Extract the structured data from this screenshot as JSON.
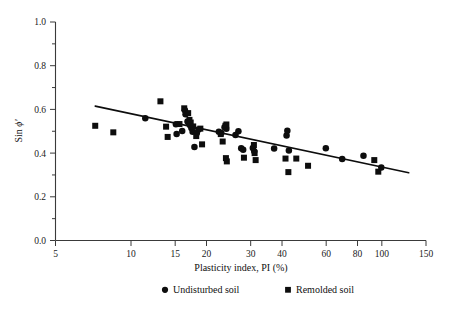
{
  "figure": {
    "background": "#ffffff",
    "ink_color": "#0d0d0d"
  },
  "axes": {
    "x": {
      "title": "Plasticity index, PI (%)",
      "scale": "log",
      "range": [
        5,
        150
      ],
      "tick_values": [
        5,
        10,
        15,
        20,
        30,
        40,
        60,
        80,
        100,
        150
      ],
      "tick_labels": [
        "5",
        "10",
        "15",
        "20",
        "30",
        "40",
        "60",
        "80",
        "100",
        "150"
      ]
    },
    "y": {
      "title_prefix": "Sin ",
      "title_symbol": "ϕ′",
      "title_full": "Sin ϕ′",
      "scale": "linear",
      "range": [
        0.0,
        1.0
      ],
      "tick_values": [
        0.0,
        0.2,
        0.4,
        0.6,
        0.8,
        1.0
      ],
      "tick_labels": [
        "0.0",
        "0.2",
        "0.4",
        "0.6",
        "0.8",
        "1.0"
      ]
    }
  },
  "legend": {
    "position": "below-axis-center",
    "entries": [
      {
        "marker": "circle",
        "label": "Undisturbed soil"
      },
      {
        "marker": "square",
        "label": "Remolded soil"
      }
    ]
  },
  "chart_data": {
    "type": "scatter",
    "title": "",
    "xlabel": "Plasticity index, PI (%)",
    "ylabel": "Sin ϕ′",
    "xscale": "log",
    "xlim": [
      5,
      150
    ],
    "ylim": [
      0.0,
      1.0
    ],
    "grid": false,
    "legend_position": "bottom",
    "series": [
      {
        "name": "Undisturbed soil",
        "marker": "circle",
        "color": "#0d0d0d",
        "points": [
          [
            11.4,
            0.56
          ],
          [
            15.1,
            0.532
          ],
          [
            15.2,
            0.487
          ],
          [
            16.0,
            0.501
          ],
          [
            16.4,
            0.596
          ],
          [
            16.5,
            0.578
          ],
          [
            16.8,
            0.545
          ],
          [
            17.0,
            0.536
          ],
          [
            17.2,
            0.527
          ],
          [
            17.4,
            0.515
          ],
          [
            17.6,
            0.498
          ],
          [
            17.9,
            0.428
          ],
          [
            18.3,
            0.492
          ],
          [
            18.6,
            0.508
          ],
          [
            22.4,
            0.498
          ],
          [
            22.9,
            0.492
          ],
          [
            23.6,
            0.518
          ],
          [
            24.0,
            0.512
          ],
          [
            26.1,
            0.483
          ],
          [
            26.8,
            0.5
          ],
          [
            27.5,
            0.422
          ],
          [
            28.0,
            0.415
          ],
          [
            30.6,
            0.423
          ],
          [
            31.0,
            0.408
          ],
          [
            37.2,
            0.421
          ],
          [
            41.7,
            0.481
          ],
          [
            42.0,
            0.502
          ],
          [
            42.6,
            0.412
          ],
          [
            59.8,
            0.422
          ],
          [
            69.5,
            0.373
          ],
          [
            84.5,
            0.388
          ],
          [
            99.5,
            0.334
          ]
        ]
      },
      {
        "name": "Remolded soil",
        "marker": "square",
        "color": "#0d0d0d",
        "points": [
          [
            7.2,
            0.525
          ],
          [
            8.5,
            0.495
          ],
          [
            13.1,
            0.637
          ],
          [
            13.8,
            0.521
          ],
          [
            14.0,
            0.474
          ],
          [
            15.6,
            0.533
          ],
          [
            16.3,
            0.605
          ],
          [
            16.9,
            0.583
          ],
          [
            17.1,
            0.552
          ],
          [
            17.3,
            0.54
          ],
          [
            17.7,
            0.522
          ],
          [
            18.2,
            0.478
          ],
          [
            18.9,
            0.512
          ],
          [
            19.2,
            0.44
          ],
          [
            22.8,
            0.487
          ],
          [
            23.2,
            0.453
          ],
          [
            23.8,
            0.525
          ],
          [
            24.0,
            0.531
          ],
          [
            23.9,
            0.377
          ],
          [
            24.1,
            0.362
          ],
          [
            28.2,
            0.379
          ],
          [
            30.9,
            0.437
          ],
          [
            31.1,
            0.4
          ],
          [
            31.4,
            0.368
          ],
          [
            41.3,
            0.375
          ],
          [
            42.4,
            0.313
          ],
          [
            45.6,
            0.375
          ],
          [
            50.8,
            0.342
          ],
          [
            93.3,
            0.368
          ],
          [
            96.8,
            0.315
          ]
        ]
      }
    ],
    "trendline": {
      "name": "regression line",
      "x_start": 7.2,
      "y_start": 0.615,
      "x_end": 128.0,
      "y_end": 0.31
    }
  }
}
